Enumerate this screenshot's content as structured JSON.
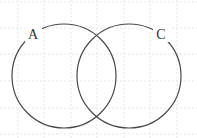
{
  "diagram": {
    "type": "venn",
    "sets": [
      {
        "label": "A",
        "cx": 64,
        "cy": 76,
        "r": 52,
        "label_x": 33,
        "label_y": 39
      },
      {
        "label": "C",
        "cx": 129,
        "cy": 76,
        "r": 52,
        "label_x": 161,
        "label_y": 39
      }
    ],
    "colors": {
      "stroke": "#4a4a4a",
      "grid": "#e6e6e6",
      "background": "#ffffff"
    },
    "grid": {
      "spacing": 26.5,
      "style": "dotted"
    }
  }
}
